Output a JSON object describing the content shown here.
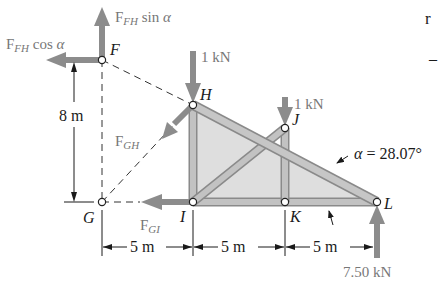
{
  "figure": {
    "type": "truss free-body diagram (method of sections)",
    "nodes": [
      {
        "id": "F",
        "label": "F",
        "x": 102,
        "y": 60
      },
      {
        "id": "G",
        "label": "G",
        "x": 102,
        "y": 202
      },
      {
        "id": "H",
        "label": "H",
        "x": 193,
        "y": 105
      },
      {
        "id": "I",
        "label": "I",
        "x": 193,
        "y": 202
      },
      {
        "id": "J",
        "label": "J",
        "x": 285,
        "y": 128
      },
      {
        "id": "K",
        "label": "K",
        "x": 285,
        "y": 202
      },
      {
        "id": "L",
        "label": "L",
        "x": 377,
        "y": 202
      }
    ],
    "members": [
      {
        "from": "H",
        "to": "L"
      },
      {
        "from": "H",
        "to": "I"
      },
      {
        "from": "I",
        "to": "K"
      },
      {
        "from": "K",
        "to": "L"
      },
      {
        "from": "I",
        "to": "J"
      },
      {
        "from": "J",
        "to": "K"
      }
    ],
    "cut_lines": [
      {
        "from": "F",
        "to": "G",
        "style": "dashed"
      },
      {
        "from": "F",
        "to": "H",
        "style": "dashed"
      },
      {
        "from": "G",
        "to": "H",
        "style": "dashed"
      },
      {
        "from": "G",
        "to": "I",
        "style": "dashed"
      }
    ],
    "forces": {
      "f_fh_sin": {
        "base": "F",
        "sym": "F",
        "sub": "FH",
        "suffix": " sin ",
        "greek": "α"
      },
      "f_fh_cos": {
        "base": "F",
        "sym": "F",
        "sub": "FH",
        "suffix": " cos ",
        "greek": "α"
      },
      "f_gh": {
        "sym": "F",
        "sub": "GH"
      },
      "f_gi": {
        "sym": "F",
        "sub": "GI"
      },
      "load_h": "1 kN",
      "load_j": "1 kN",
      "reaction_l": "7.50 kN"
    },
    "dimensions": {
      "height": "8 m",
      "span_gi": "5 m",
      "span_ik": "5 m",
      "span_kl": "5 m"
    },
    "angle": {
      "symbol": "α",
      "value": "= 28.07°"
    },
    "colors": {
      "member_fill": "#b9b9b9",
      "member_edge": "#8a8a8a",
      "panel_fill": "#dcdcdc",
      "force_arrow": "#8c8c8c",
      "text": "#1a1a1a",
      "force_text": "#777777"
    }
  },
  "background_text": {
    "margin_fragments": [
      "r",
      "–"
    ]
  }
}
